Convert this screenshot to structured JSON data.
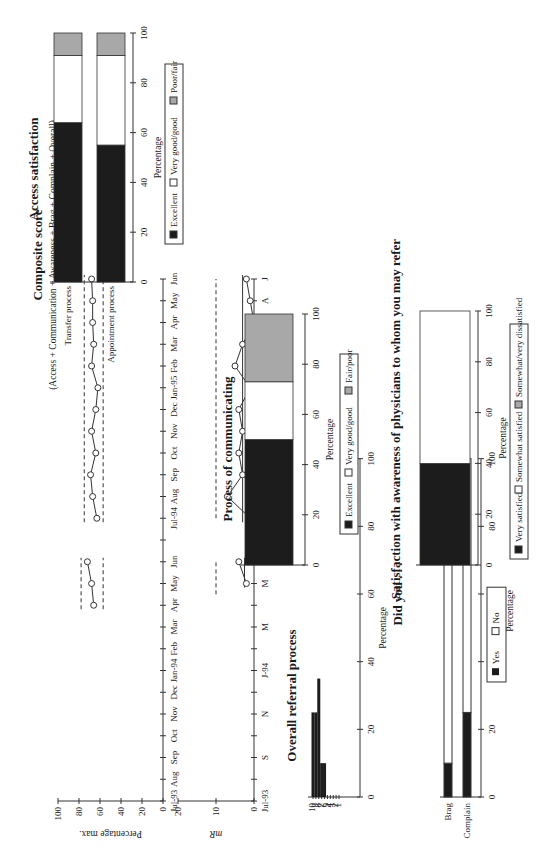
{
  "page": {
    "orientation": "rotated 90 degrees counterclockwise (landscape figure page)"
  },
  "colors": {
    "dark": "#1c1c1c",
    "mid": "#a8a8a8",
    "light": "#ffffff",
    "line": "#333333"
  },
  "chart_data": [
    {
      "id": "composite",
      "type": "line",
      "title": "Composite score",
      "subtitle": "(Access + Communication + Awareness + Brag + Complain + Overall)",
      "ylabel": "Percentage max.",
      "ylim": [
        0,
        100
      ],
      "yticks": [
        0,
        20,
        40,
        60,
        80,
        100
      ],
      "x": [
        "Jul-93",
        "Aug",
        "Sep",
        "Oct",
        "Nov",
        "Dec",
        "Jan-94",
        "Feb",
        "Mar",
        "Apr",
        "May",
        "Jun",
        "",
        "Jul-94",
        "Aug",
        "Sep",
        "Oct",
        "Nov",
        "Dec",
        "Jan-95",
        "Feb",
        "Mar",
        "Apr",
        "May",
        "Jun"
      ],
      "series": [
        {
          "name": "Phase 1",
          "x_index": [
            9,
            10,
            11
          ],
          "values": [
            66,
            68,
            72
          ]
        },
        {
          "name": "Phase 2",
          "x_index": [
            13,
            14,
            15,
            16,
            17,
            18,
            19,
            20,
            21,
            22,
            23,
            24
          ],
          "values": [
            63,
            67,
            69,
            64,
            68,
            64,
            62,
            68,
            66,
            67,
            67,
            68
          ]
        }
      ],
      "control_limits": [
        {
          "segment": "phase1",
          "upper": 78,
          "lower": 57
        },
        {
          "segment": "phase2",
          "upper": 75,
          "lower": 57
        }
      ]
    },
    {
      "id": "moving_range",
      "type": "line",
      "title": "",
      "ylabel": "mR",
      "xlabel": "Month",
      "ylim": [
        0,
        20
      ],
      "yticks": [
        0,
        10,
        20
      ],
      "x": [
        "Jul-93",
        "A",
        "S",
        "O",
        "N",
        "D",
        "J-94",
        "F",
        "M",
        "A",
        "M",
        "J",
        "",
        "Jul-94",
        "A",
        "S",
        "O",
        "N",
        "D",
        "J-95",
        "F",
        "M",
        "A",
        "M",
        "J"
      ],
      "xticklabels_shown": [
        "Jul-93",
        "S",
        "N",
        "J-94",
        "M",
        "M",
        "A",
        "O",
        "D",
        "F",
        "A",
        "J"
      ],
      "series": [
        {
          "name": "Phase 1",
          "x_index": [
            10,
            11
          ],
          "values": [
            2,
            4
          ]
        },
        {
          "name": "Phase 2",
          "x_index": [
            13,
            14,
            15,
            16,
            17,
            18,
            19,
            20,
            21,
            22,
            23,
            24
          ],
          "values": [
            1,
            7,
            3,
            4,
            3,
            4,
            1,
            5,
            3,
            0,
            1,
            2
          ]
        }
      ],
      "control_limits": [
        {
          "segment": "phase1",
          "upper": 10
        },
        {
          "segment": "phase2",
          "upper": 10
        }
      ]
    },
    {
      "id": "overall_referral",
      "type": "bar",
      "title": "Overall referral process",
      "xlabel": "Percentage",
      "xlim": [
        0,
        100
      ],
      "xticks": [
        0,
        20,
        40,
        60,
        80,
        100
      ],
      "categories": [
        "10",
        "9",
        "8",
        "7",
        "6",
        "5",
        "4",
        "3",
        "2",
        "1"
      ],
      "values": [
        25,
        25,
        35,
        10,
        10,
        0,
        0,
        0,
        0,
        0
      ]
    },
    {
      "id": "did_you",
      "type": "bar",
      "stacked": true,
      "title": "Did you . . .",
      "xlabel": "Percentage",
      "xlim": [
        0,
        100
      ],
      "xticks": [
        0,
        20,
        40,
        60,
        80,
        100
      ],
      "categories": [
        "Brag",
        "Complain"
      ],
      "series": [
        {
          "name": "Yes",
          "values": [
            10,
            25
          ]
        },
        {
          "name": "No",
          "values": [
            90,
            75
          ]
        }
      ],
      "legend": [
        "Yes",
        "No"
      ]
    },
    {
      "id": "access_satisfaction",
      "type": "bar",
      "stacked": true,
      "title": "Access satisfaction",
      "xlabel": "Percentage",
      "xlim": [
        0,
        100
      ],
      "xticks": [
        0,
        20,
        40,
        60,
        80,
        100
      ],
      "categories": [
        "Transfer process",
        "Appointment process"
      ],
      "series": [
        {
          "name": "Excellent",
          "values": [
            64,
            55
          ]
        },
        {
          "name": "Very good/good",
          "values": [
            27,
            36
          ]
        },
        {
          "name": "Poor/fair",
          "values": [
            9,
            9
          ]
        }
      ],
      "legend": [
        "Excellent",
        "Very good/good",
        "Poor/fair"
      ]
    },
    {
      "id": "process_communicating",
      "type": "bar",
      "stacked": true,
      "title": "Process of communicating",
      "xlabel": "Percentage",
      "xlim": [
        0,
        100
      ],
      "xticks": [
        0,
        20,
        40,
        60,
        80,
        100
      ],
      "categories": [
        ""
      ],
      "series": [
        {
          "name": "Excellent",
          "values": [
            50
          ]
        },
        {
          "name": "Very good/good",
          "values": [
            23
          ]
        },
        {
          "name": "Fair/poor",
          "values": [
            27
          ]
        }
      ],
      "legend": [
        "Excellent",
        "Very good/good",
        "Fair/poor"
      ]
    },
    {
      "id": "awareness_satisfaction",
      "type": "bar",
      "stacked": true,
      "title": "Satisfaction with awareness of physicians to whom you may refer",
      "xlabel": "Percentage",
      "xlim": [
        0,
        100
      ],
      "xticks": [
        0,
        20,
        40,
        60,
        80,
        100
      ],
      "categories": [
        ""
      ],
      "series": [
        {
          "name": "Very satisfied",
          "values": [
            40
          ]
        },
        {
          "name": "Somewhat satisfied",
          "values": [
            60
          ]
        },
        {
          "name": "Somewhat/very dissatisfied",
          "values": [
            0
          ]
        }
      ],
      "legend": [
        "Very satisfied",
        "Somewhat satisfied",
        "Somewhat/very dissatisfied"
      ]
    }
  ],
  "labels": {
    "composite_title": "Composite score",
    "composite_subtitle": "(Access + Communication + Awareness + Brag + Complain + Overall)",
    "composite_ylabel": "Percentage max.",
    "mr_ylabel": "mR",
    "month_label": "Month",
    "referral_title": "Overall referral process",
    "percentage": "Percentage",
    "didyou_title": "Did you . . .",
    "brag": "Brag",
    "complain": "Complain",
    "yes": "Yes",
    "no": "No",
    "access_title": "Access satisfaction",
    "transfer": "Transfer process",
    "appointment": "Appointment process",
    "excellent": "Excellent",
    "vgood": "Very good/good",
    "poorfair": "Poor/fair",
    "fairpoor": "Fair/poor",
    "comm_title": "Process of communicating",
    "aware_title": "Satisfaction with awareness of physicians to whom you may refer",
    "very_sat": "Very satisfied",
    "somewhat_sat": "Somewhat satisfied",
    "dissat": "Somewhat/very dissatisfied"
  },
  "ticks": {
    "pct": [
      "0",
      "20",
      "40",
      "60",
      "80",
      "100"
    ],
    "mr": [
      "0",
      "10",
      "20"
    ],
    "months_top": [
      "Jul-93",
      "Aug",
      "Sep",
      "Oct",
      "Nov",
      "Dec",
      "Jan-94",
      "Feb",
      "Mar",
      "Apr",
      "May",
      "Jun",
      "Jul-94",
      "Aug",
      "Sep",
      "Oct",
      "Nov",
      "Dec",
      "Jan-95",
      "Feb",
      "Mar",
      "Apr",
      "May",
      "Jun"
    ],
    "months_mr": [
      "Jul-93",
      "S",
      "N",
      "J-94",
      "M",
      "M",
      "A",
      "O",
      "D",
      "F",
      "A",
      "J"
    ],
    "referral_scale": [
      "10",
      "9",
      "8",
      "7",
      "6",
      "5",
      "4",
      "3",
      "2",
      "1"
    ]
  }
}
